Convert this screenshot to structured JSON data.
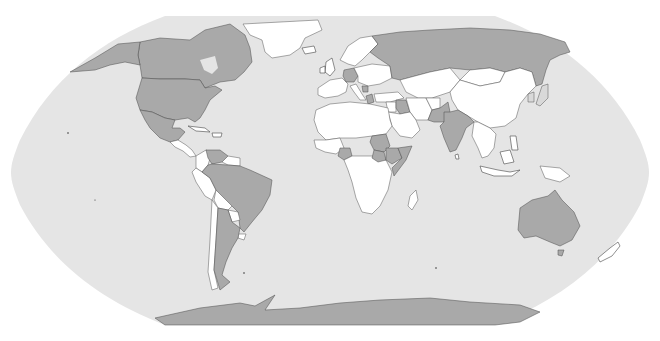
{
  "map": {
    "projection": "Robinson",
    "colors": {
      "ocean": "#e5e5e5",
      "land_default": "#ffffff",
      "land_highlighted": "#a9a9a9",
      "border": "#555555",
      "page_background": "#ffffff"
    },
    "highlighted_countries": [
      "United States",
      "Canada",
      "Mexico",
      "Venezuela",
      "Brazil",
      "Argentina",
      "Germany",
      "Greece",
      "Serbia",
      "Russia",
      "Iraq",
      "Pakistan",
      "India",
      "Nigeria",
      "Sudan",
      "South Sudan",
      "Ethiopia",
      "Somalia",
      "Japan",
      "Australia",
      "Antarctica"
    ],
    "legend": null,
    "title": null
  }
}
